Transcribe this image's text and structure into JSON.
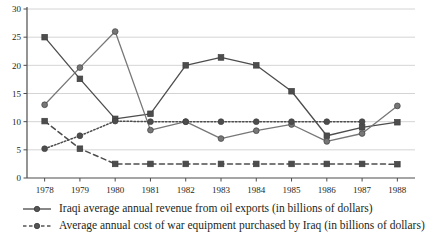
{
  "chart_data": {
    "type": "line",
    "title": "",
    "xlabel": "",
    "ylabel": "",
    "x": [
      1978,
      1979,
      1980,
      1981,
      1982,
      1983,
      1984,
      1985,
      1986,
      1987,
      1988
    ],
    "xtick_labels": [
      "1978",
      "1979",
      "1980",
      "1981",
      "1982",
      "1983",
      "1984",
      "1985",
      "1986",
      "1987",
      "1988"
    ],
    "ytick_labels": [
      "0",
      "5",
      "10",
      "15",
      "20",
      "25",
      "30"
    ],
    "yticks": [
      0,
      5,
      10,
      15,
      20,
      25,
      30
    ],
    "ylim": [
      0,
      30
    ],
    "grid": "horizontal",
    "legend_position": "below",
    "series": [
      {
        "name": "oil-revenue-rising",
        "marker": "square",
        "linestyle": "solid",
        "color": "#4d4d4d",
        "values": [
          25.0,
          17.6,
          10.5,
          11.4,
          20.0,
          21.4,
          20.0,
          15.4,
          7.5,
          9.0,
          9.9
        ]
      },
      {
        "name": "oil-revenue-peak",
        "marker": "circle",
        "linestyle": "solid",
        "color": "#777777",
        "values": [
          13.0,
          19.6,
          26.0,
          8.5,
          10.0,
          7.0,
          8.4,
          9.5,
          6.5,
          7.9,
          12.8
        ]
      },
      {
        "name": "war-equipment-rising",
        "marker": "circle",
        "linestyle": "dotted",
        "color": "#4d4d4d",
        "values": [
          5.2,
          7.5,
          10.1,
          10.0,
          10.0,
          10.0,
          10.0,
          10.0,
          10.0,
          10.0,
          null
        ]
      },
      {
        "name": "war-equipment-falling",
        "marker": "square",
        "linestyle": "dashed",
        "color": "#4d4d4d",
        "values": [
          10.1,
          5.2,
          2.5,
          2.5,
          2.5,
          2.5,
          2.5,
          2.5,
          2.5,
          2.5,
          2.45
        ]
      }
    ],
    "legend": [
      {
        "label": "Iraqi average annual revenue from oil exports (in billions of dollars)",
        "marker": "circle",
        "linestyle": "solid",
        "color": "#555555"
      },
      {
        "label": "Average annual cost of war equipment purchased by Iraq (in billions of dollars)",
        "marker": "circle",
        "linestyle": "dashed",
        "color": "#555555"
      }
    ],
    "colors": {
      "axis": "#4d4d4d",
      "grid": "#c9c9c9",
      "text": "#231f20",
      "series_dark": "#4d4d4d",
      "series_light": "#777777"
    }
  }
}
